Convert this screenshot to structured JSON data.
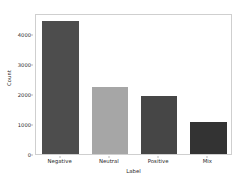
{
  "chart_data": {
    "type": "bar",
    "title": "",
    "xlabel": "Label",
    "ylabel": "Count",
    "categories": [
      "Negative",
      "Neutral",
      "Positive",
      "Mix"
    ],
    "values": [
      4450,
      2250,
      1950,
      1080
    ],
    "ylim": [
      0,
      4700
    ],
    "yticks": [
      0,
      1000,
      2000,
      3000,
      4000
    ],
    "ytick_labels": [
      "0",
      "1000",
      "2000",
      "3000",
      "4000"
    ],
    "grid": false,
    "legend": null,
    "bar_colors": [
      "#4d4d4d",
      "#a6a6a6",
      "#464646",
      "#333333"
    ],
    "frame_color": "#cfcfcf",
    "background": "#ffffff",
    "text_color": "#2b2b2b"
  }
}
